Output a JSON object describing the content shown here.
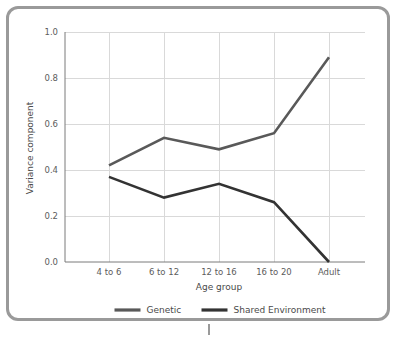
{
  "chart_data": {
    "type": "line",
    "title": "",
    "xlabel": "Age group",
    "ylabel": "Variance component",
    "categories": [
      "4 to 6",
      "6 to 12",
      "12 to 16",
      "16 to 20",
      "Adult"
    ],
    "series": [
      {
        "name": "Genetic",
        "color": "#595959",
        "values": [
          0.42,
          0.54,
          0.49,
          0.56,
          0.89
        ]
      },
      {
        "name": "Shared Environment",
        "color": "#333333",
        "values": [
          0.37,
          0.28,
          0.34,
          0.26,
          0.0
        ]
      }
    ],
    "ylim": [
      0.0,
      1.0
    ],
    "yticks": [
      "0.0",
      "0.2",
      "0.4",
      "0.6",
      "0.8",
      "1.0"
    ],
    "ytick_values": [
      0.0,
      0.2,
      0.4,
      0.6,
      0.8,
      1.0
    ],
    "grid": true,
    "grid_color": "#d9d9d9",
    "legend_position": "bottom",
    "axis_color": "#7b7b7b",
    "frame_color": "#9a9a9a",
    "background": "#ffffff"
  },
  "legend": {
    "items": [
      {
        "label": "Genetic",
        "color": "#595959"
      },
      {
        "label": "Shared Environment",
        "color": "#333333"
      }
    ]
  }
}
